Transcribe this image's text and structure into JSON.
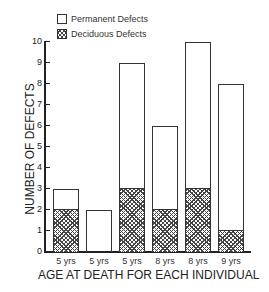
{
  "chart_data": {
    "type": "bar",
    "stacked": true,
    "title": "",
    "xlabel": "AGE AT DEATH FOR EACH INDIVIDUAL",
    "ylabel": "NUMBER OF DEFECTS",
    "ylim": [
      0,
      10
    ],
    "yticks": [
      "0",
      "1",
      "2",
      "3",
      "4",
      "5",
      "6",
      "7",
      "8",
      "9",
      "10"
    ],
    "categories": [
      "5 yrs",
      "5 yrs",
      "5 yrs",
      "8 yrs",
      "8 yrs",
      "9 yrs"
    ],
    "series": [
      {
        "name": "Deciduous Defects",
        "pattern": "crosshatch",
        "values": [
          2,
          0,
          3,
          2,
          3,
          1
        ]
      },
      {
        "name": "Permanent Defects",
        "pattern": "white",
        "values": [
          1,
          2,
          6,
          4,
          7,
          7
        ]
      }
    ],
    "totals": [
      3,
      2,
      9,
      6,
      10,
      8
    ],
    "grid": false,
    "legend": {
      "position": "top-left",
      "entries": [
        {
          "label": "Permanent Defects",
          "pattern": "white"
        },
        {
          "label": "Deciduous Defects",
          "pattern": "crosshatch"
        }
      ]
    }
  }
}
